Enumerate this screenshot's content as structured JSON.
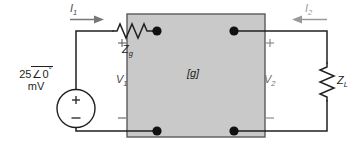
{
  "figure": {
    "type": "two-port-network-circuit-schematic",
    "background_color": "#ffffff",
    "line_color": "#231f20",
    "box_fill_color": "#c9c9c9",
    "box_border_color": "#5a5a5a"
  },
  "source": {
    "name": "independent-voltage-source",
    "magnitude": "25",
    "angle_symbol": "∠",
    "angle": "0",
    "degree_symbol": "°",
    "value_line": "25∠0°",
    "units": "mV",
    "plus_sign": "+",
    "minus_sign": "−"
  },
  "components": {
    "source_impedance": {
      "label": "Z",
      "subscript": "g",
      "full": "Zg",
      "type": "resistor-zigzag-horizontal"
    },
    "load_impedance": {
      "label": "Z",
      "subscript": "L",
      "full": "ZL",
      "type": "resistor-zigzag-vertical"
    },
    "two_port": {
      "label": "[g]",
      "description": "g-parameter two-port network block"
    }
  },
  "currents": [
    {
      "name": "input-current",
      "label": "I",
      "subscript": "1",
      "full": "I1",
      "direction": "right"
    },
    {
      "name": "output-current",
      "label": "I",
      "subscript": "2",
      "full": "I2",
      "direction": "left"
    }
  ],
  "voltages": [
    {
      "name": "input-port-voltage",
      "label": "V",
      "subscript": "1",
      "full": "V1",
      "plus": "+",
      "minus": "−"
    },
    {
      "name": "output-port-voltage",
      "label": "V",
      "subscript": "2",
      "full": "V2",
      "plus": "+",
      "minus": "−"
    }
  ],
  "terminals": {
    "count": 4,
    "style": "filled-dot"
  }
}
